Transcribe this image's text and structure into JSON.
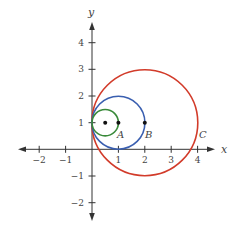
{
  "figure": {
    "type": "coordinate-plane-diagram",
    "axes": {
      "x_label": "x",
      "y_label": "y",
      "x_ticks": [
        "−2",
        "−1",
        "1",
        "2",
        "3",
        "4"
      ],
      "y_ticks": [
        "4",
        "3",
        "2",
        "1",
        "−1",
        "−2"
      ],
      "x_range": [
        -2.6,
        4.7
      ],
      "y_range": [
        -2.6,
        4.6
      ]
    },
    "circles": [
      {
        "name": "green-circle",
        "center": [
          0.5,
          1
        ],
        "radius": 0.5,
        "color": "#3a8a3a"
      },
      {
        "name": "blue-circle",
        "center": [
          1,
          1
        ],
        "radius": 1,
        "color": "#3a5fb0"
      },
      {
        "name": "red-circle",
        "center": [
          2,
          1
        ],
        "radius": 2,
        "color": "#d23b2a"
      }
    ],
    "points": [
      {
        "name": "green-center",
        "coords": [
          0.5,
          1
        ]
      },
      {
        "name": "A",
        "coords": [
          1,
          1
        ],
        "label": "A"
      },
      {
        "name": "B",
        "coords": [
          2,
          1
        ],
        "label": "B"
      }
    ],
    "labels": {
      "A": "A",
      "B": "B",
      "C": "C"
    },
    "colors": {
      "axis": "#333333",
      "green": "#3a8a3a",
      "blue": "#3a5fb0",
      "red": "#d23b2a"
    }
  }
}
